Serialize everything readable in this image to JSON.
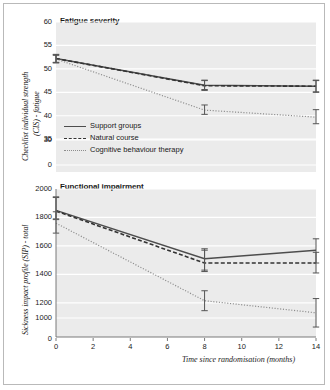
{
  "figure": {
    "background": "#ffffff",
    "plot_background": "#ebebeb",
    "gridline_color": "#ffffff",
    "border_color": "#b9b9b9"
  },
  "legend": {
    "position": "inside-top-panel-lower-left",
    "items": [
      {
        "label": "Support groups",
        "style": "solid",
        "color": "#4d4d4d"
      },
      {
        "label": "Natural course",
        "style": "dashed",
        "color": "#333333"
      },
      {
        "label": "Cognitive behaviour therapy",
        "style": "dotted",
        "color": "#8c8c8c"
      }
    ]
  },
  "xaxis": {
    "label": "Time since randomisation (months)",
    "ticks": [
      "0",
      "2",
      "4",
      "6",
      "8",
      "10",
      "12",
      "14"
    ],
    "values": [
      0,
      2,
      4,
      6,
      8,
      10,
      12,
      14
    ],
    "min": 0,
    "max": 14
  },
  "chart_data": [
    {
      "type": "line",
      "title": "Fatigue severity",
      "ylabel_line1": "Checklist individual strength",
      "ylabel_line2": "(CIS) - fatigue",
      "xlabel": "",
      "x": [
        0,
        8,
        14
      ],
      "yticks": [
        "0",
        "30",
        "35",
        "40",
        "45",
        "50",
        "55",
        "60"
      ],
      "ytick_values": [
        0,
        30,
        35,
        40,
        45,
        50,
        55,
        60
      ],
      "ylim": [
        28,
        60
      ],
      "xlim": [
        0,
        14
      ],
      "grid": true,
      "series": [
        {
          "name": "Support groups",
          "style": "solid",
          "color": "#4d4d4d",
          "values": [
            52.2,
            46.5,
            46.3
          ],
          "error_low": [
            51.4,
            45.6,
            45.1
          ],
          "error_high": [
            53.0,
            47.6,
            47.6
          ]
        },
        {
          "name": "Natural course",
          "style": "dashed",
          "color": "#333333",
          "values": [
            52.2,
            46.4,
            46.3
          ],
          "error_low": [
            51.3,
            45.4,
            45.0
          ],
          "error_high": [
            53.1,
            47.5,
            47.5
          ]
        },
        {
          "name": "Cognitive behaviour therapy",
          "style": "dotted",
          "color": "#8c8c8c",
          "values": [
            52.1,
            41.2,
            39.7
          ],
          "error_low": [
            51.3,
            40.3,
            38.3
          ],
          "error_high": [
            52.9,
            42.3,
            41.3
          ]
        }
      ]
    },
    {
      "type": "line",
      "title": "Functional impairment",
      "ylabel_line1": "Sickness impact profile (SIP) - total",
      "ylabel_line2": "",
      "xlabel": "Time since randomisation (months)",
      "x": [
        0,
        8,
        14
      ],
      "yticks": [
        "0",
        "1000",
        "1200",
        "1400",
        "1600",
        "1800",
        "2000"
      ],
      "ytick_values": [
        0,
        1000,
        1200,
        1400,
        1600,
        1800,
        2000
      ],
      "ylim": [
        960,
        2000
      ],
      "xlim": [
        0,
        14
      ],
      "grid": true,
      "series": [
        {
          "name": "Support groups",
          "style": "solid",
          "color": "#4d4d4d",
          "values": [
            1850,
            1510,
            1570
          ],
          "error_low": [
            1790,
            1430,
            1480
          ],
          "error_high": [
            1945,
            1580,
            1650
          ]
        },
        {
          "name": "Natural course",
          "style": "dashed",
          "color": "#333333",
          "values": [
            1845,
            1480,
            1480
          ],
          "error_low": [
            1785,
            1420,
            1410
          ],
          "error_high": [
            1940,
            1570,
            1555
          ]
        },
        {
          "name": "Cognitive behaviour therapy",
          "style": "dotted",
          "color": "#8c8c8c",
          "values": [
            1760,
            1215,
            1130
          ],
          "error_low": [
            1690,
            1145,
            1030
          ],
          "error_high": [
            1840,
            1285,
            1230
          ]
        }
      ]
    }
  ]
}
